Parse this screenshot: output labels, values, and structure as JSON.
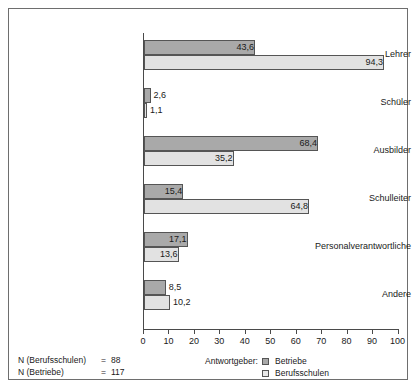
{
  "chart_data": {
    "type": "bar",
    "orientation": "horizontal",
    "title": "",
    "subtitle": "",
    "xlabel": "",
    "ylabel": "",
    "xlim": [
      0,
      100
    ],
    "xticks": [
      0,
      10,
      20,
      30,
      40,
      50,
      60,
      70,
      80,
      90,
      100
    ],
    "xticklabels": [
      "0",
      "10",
      "20",
      "30",
      "40",
      "50",
      "60",
      "70",
      "80",
      "90",
      "100"
    ],
    "grid": false,
    "legend_position": "bottom-right",
    "categories": [
      "Lehrer",
      "Schüler",
      "Ausbilder",
      "Schulleiter",
      "Personalverantwortliche",
      "Andere"
    ],
    "series": [
      {
        "name": "Betriebe",
        "color": "#a9a9a9",
        "values": [
          43.6,
          2.6,
          68.4,
          15.4,
          17.1,
          8.5
        ],
        "labels": [
          "43,6",
          "2,6",
          "68,4",
          "15,4",
          "17,1",
          "8,5"
        ]
      },
      {
        "name": "Berufsschulen",
        "color": "#e2e2e2",
        "values": [
          94.3,
          1.1,
          35.2,
          64.8,
          13.6,
          10.2
        ],
        "labels": [
          "94,3",
          "1,1",
          "35,2",
          "64,8",
          "13,6",
          "10,2"
        ]
      }
    ],
    "annotations": [
      "N (Berufsschulen) = 88",
      "N (Betriebe) = 117"
    ]
  },
  "legend": {
    "title": "Antwortgeber:",
    "items": [
      {
        "label": "Betriebe"
      },
      {
        "label": "Berufsschulen"
      }
    ]
  },
  "footnotes": {
    "rows": [
      {
        "label": "N (Berufsschulen)",
        "eq": "=",
        "value": "88"
      },
      {
        "label": "N (Betriebe)",
        "eq": "=",
        "value": "117"
      }
    ]
  },
  "colors": {
    "betriebe": "#a9a9a9",
    "berufsschulen": "#e2e2e2",
    "axis": "#4a4a4a",
    "frame": "#6e6e6e",
    "text": "#1a1a1a"
  }
}
